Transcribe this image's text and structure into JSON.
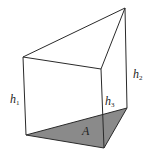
{
  "figure": {
    "colors": {
      "stroke": "#2a2a2a",
      "base_fill": "#8a8a8a",
      "background": "#ffffff"
    },
    "vertices": {
      "top_left": [
        23,
        57
      ],
      "top_front": [
        101,
        69
      ],
      "top_apex": [
        125,
        8
      ],
      "bottom_left": [
        26,
        135
      ],
      "bottom_front": [
        104,
        148
      ],
      "bottom_back": [
        127,
        108
      ]
    },
    "labels": {
      "h1": {
        "base": "h",
        "sub": "1"
      },
      "h2": {
        "base": "h",
        "sub": "2"
      },
      "h3": {
        "base": "h",
        "sub": "3"
      },
      "area": "A"
    }
  }
}
